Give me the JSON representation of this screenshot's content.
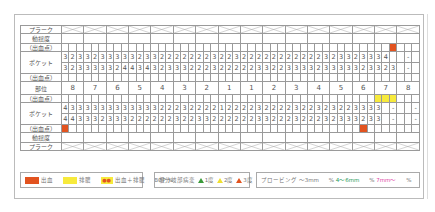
{
  "row_labels": {
    "plaque": "プラーク",
    "mobility": "動揺度",
    "bleeding": "（出血点）",
    "pocket": "ポケット",
    "site": "部位"
  },
  "teeth_numbers": [
    "8",
    "7",
    "6",
    "5",
    "4",
    "3",
    "2",
    "1",
    "1",
    "2",
    "3",
    "4",
    "5",
    "6",
    "7",
    "8"
  ],
  "upper": {
    "pocket_row1": [
      "3",
      "2",
      "3",
      "3",
      "2",
      "3",
      "3",
      "3",
      "3",
      "3",
      "2",
      "3",
      "3",
      "2",
      "2",
      "2",
      "2",
      "2",
      "2",
      "2",
      "3",
      "2",
      "2",
      "3",
      "2",
      "2",
      "2",
      "2",
      "2",
      "2",
      "2",
      "2",
      "2",
      "2",
      "2",
      "3",
      "2",
      "3",
      "3",
      "2",
      "3",
      "3",
      "3",
      "4",
      "",
      "",
      "-",
      "",
      ""
    ],
    "pocket_row2": [
      "3",
      "2",
      "3",
      "3",
      "3",
      "3",
      "3",
      "2",
      "4",
      "4",
      "3",
      "4",
      "3",
      "2",
      "3",
      "3",
      "3",
      "2",
      "2",
      "2",
      "3",
      "2",
      "2",
      "2",
      "2",
      "2",
      "3",
      "3",
      "2",
      "2",
      "3",
      "3",
      "3",
      "3",
      "2",
      "3",
      "3",
      "3",
      "3",
      "3",
      "2",
      "3",
      "3",
      "2",
      "3",
      "",
      "-",
      ""
    ],
    "bleeding_marks": [
      44
    ]
  },
  "lower": {
    "pocket_row1": [
      "4",
      "3",
      "3",
      "3",
      "3",
      "3",
      "3",
      "3",
      "3",
      "3",
      "3",
      "3",
      "3",
      "2",
      "2",
      "2",
      "3",
      "2",
      "2",
      "2",
      "2",
      "1",
      "2",
      "2",
      "2",
      "2",
      "3",
      "2",
      "2",
      "2",
      "2",
      "3",
      "2",
      "2",
      "3",
      "2",
      "3",
      "2",
      "2",
      "3",
      "3",
      "3",
      "3",
      "",
      "-",
      "",
      "",
      "-"
    ],
    "pocket_row2": [
      "4",
      "4",
      "3",
      "3",
      "3",
      "2",
      "3",
      "3",
      "3",
      "2",
      "2",
      "2",
      "2",
      "2",
      "2",
      "3",
      "2",
      "2",
      "3",
      "3",
      "2",
      "2",
      "2",
      "2",
      "2",
      "2",
      "3",
      "3",
      "2",
      "2",
      "2",
      "3",
      "2",
      "2",
      "2",
      "3",
      "2",
      "3",
      "3",
      "3",
      "2",
      "3",
      "3",
      "",
      "-",
      "",
      "",
      "-"
    ],
    "pus_marks": [
      42,
      43,
      44
    ],
    "bleeding_marks_bottom": [
      0,
      40
    ]
  },
  "legend": {
    "bleeding_label": "出血",
    "pus_label": "排膿",
    "both_symbol": "●●",
    "both_label": "出血＋排膿",
    "bop_label": "BOP %",
    "furcation_title": "根分岐部病変",
    "furcation_1": "1度",
    "furcation_2": "2度",
    "furcation_3": "3度",
    "probing_title": "プロービング",
    "probing_1": "〜3mm",
    "probing_1_unit": "%",
    "probing_2": "4〜6mm",
    "probing_2_unit": "%",
    "probing_3": "7mm〜",
    "probing_3_unit": "%"
  },
  "colors": {
    "bleeding": "#e2531f",
    "pus": "#f7ea3c",
    "furcation_1": "#3a9a3a",
    "furcation_2": "#f7ea3c",
    "furcation_3": "#e2531f",
    "probing_2": "#2a9a5a",
    "probing_3": "#e04aa8"
  }
}
